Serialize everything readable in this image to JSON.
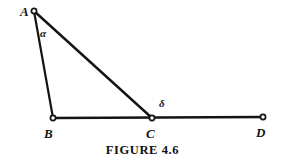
{
  "figure": {
    "caption": "FIGURE 4.6",
    "stroke_color": "#141414",
    "background_color": "#ffffff",
    "marker_fill": "#ffffff",
    "line_width": 2.2,
    "marker_radius": 2.6
  },
  "points": [
    {
      "id": "A",
      "label": "A",
      "x": 34,
      "y": 11,
      "label_x": 20,
      "label_y": 5
    },
    {
      "id": "B",
      "label": "B",
      "x": 53,
      "y": 118,
      "label_x": 44,
      "label_y": 127
    },
    {
      "id": "C",
      "label": "C",
      "x": 152,
      "y": 118,
      "label_x": 146,
      "label_y": 127
    },
    {
      "id": "D",
      "label": "D",
      "x": 263,
      "y": 117,
      "label_x": 256,
      "label_y": 126
    }
  ],
  "segments": [
    {
      "id": "AB",
      "from": "A",
      "to": "B",
      "x1": 34,
      "y1": 11,
      "x2": 53,
      "y2": 118
    },
    {
      "id": "AC",
      "from": "A",
      "to": "C",
      "x1": 34,
      "y1": 11,
      "x2": 152,
      "y2": 118
    },
    {
      "id": "BD",
      "from": "B",
      "to": "D",
      "x1": 53,
      "y1": 118,
      "x2": 263,
      "y2": 117
    }
  ],
  "angles": [
    {
      "id": "alpha",
      "symbol": "α",
      "at_point": "A",
      "label_x": 40,
      "label_y": 28
    },
    {
      "id": "delta",
      "symbol": "δ",
      "at_point": "C",
      "label_x": 159,
      "label_y": 98
    }
  ]
}
